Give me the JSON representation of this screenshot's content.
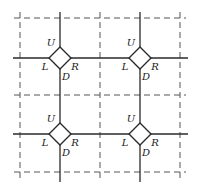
{
  "diagram": {
    "colors": {
      "line": "#2a2a2a",
      "dashed": "#555555",
      "background": "#ffffff"
    },
    "dashed_grid": {
      "x": [
        20,
        100,
        180
      ],
      "y": [
        18,
        95,
        172
      ]
    },
    "solid_lines": {
      "x": [
        60,
        140
      ],
      "y": [
        58,
        134
      ]
    },
    "vertex_labels": {
      "up": "U",
      "left": "L",
      "down": "D",
      "right": "R"
    },
    "vertices": [
      {
        "id": "v-top-left",
        "cx": 60,
        "cy": 58,
        "labels": [
          "U",
          "L",
          "D",
          "R"
        ]
      },
      {
        "id": "v-top-right",
        "cx": 140,
        "cy": 58,
        "labels": [
          "U",
          "L",
          "D",
          "R"
        ]
      },
      {
        "id": "v-bottom-left",
        "cx": 60,
        "cy": 134,
        "labels": [
          "U",
          "L",
          "D",
          "R"
        ]
      },
      {
        "id": "v-bottom-right",
        "cx": 140,
        "cy": 134,
        "labels": [
          "U",
          "L",
          "D",
          "R"
        ]
      }
    ]
  }
}
